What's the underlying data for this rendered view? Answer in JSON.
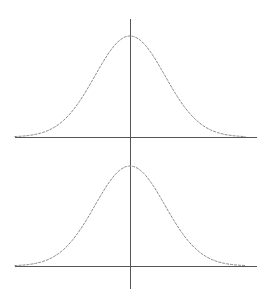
{
  "chart_data": [
    {
      "type": "line",
      "title": "",
      "xlabel": "",
      "ylabel": "",
      "description": "Standard normal (Gaussian) bell curve centered on the vertical axis",
      "distribution": {
        "mean": 0,
        "sd": 1
      },
      "xlim": [
        -3.5,
        3.5
      ],
      "ylim": [
        0,
        0.4
      ],
      "grid": false,
      "legend": null,
      "x": [
        -3.3,
        -3,
        -2.5,
        -2,
        -1.5,
        -1,
        -0.5,
        0,
        0.5,
        1,
        1.5,
        2,
        2.5,
        3,
        3.3
      ],
      "values": [
        0.0017,
        0.0044,
        0.0175,
        0.054,
        0.1295,
        0.242,
        0.3521,
        0.3989,
        0.3521,
        0.242,
        0.1295,
        0.054,
        0.0175,
        0.0044,
        0.0017
      ]
    },
    {
      "type": "line",
      "title": "",
      "xlabel": "",
      "ylabel": "",
      "description": "Standard normal (Gaussian) bell curve centered on the vertical axis",
      "distribution": {
        "mean": 0,
        "sd": 1
      },
      "xlim": [
        -3.5,
        3.5
      ],
      "ylim": [
        0,
        0.4
      ],
      "grid": false,
      "legend": null,
      "x": [
        -3.3,
        -3,
        -2.5,
        -2,
        -1.5,
        -1,
        -0.5,
        0,
        0.5,
        1,
        1.5,
        2,
        2.5,
        3,
        3.3
      ],
      "values": [
        0.0017,
        0.0044,
        0.0175,
        0.054,
        0.1295,
        0.242,
        0.3521,
        0.3989,
        0.3521,
        0.242,
        0.1295,
        0.054,
        0.0175,
        0.0044,
        0.0017
      ]
    }
  ],
  "layout": {
    "plots": [
      {
        "x_axis_y": 137,
        "y_axis_top": 19,
        "y_axis_bottom": 160,
        "peak_y": 36
      },
      {
        "x_axis_y": 266,
        "y_axis_top": 150,
        "y_axis_bottom": 289,
        "peak_y": 166
      }
    ],
    "x_axis_left": 15,
    "x_axis_right": 257,
    "center_x": 130,
    "sigma_px": 35,
    "colors": {
      "axis": "#555555",
      "curve": "#8a8a8a"
    }
  }
}
